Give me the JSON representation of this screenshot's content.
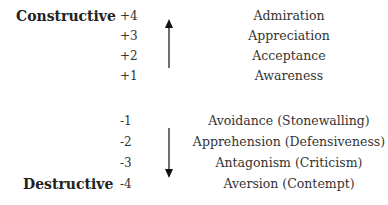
{
  "poles": {
    "constructive": "Constructive",
    "destructive": "Destructive"
  },
  "scale": {
    "positive": [
      {
        "value": "+4",
        "term": "Admiration"
      },
      {
        "value": "+3",
        "term": "Appreciation"
      },
      {
        "value": "+2",
        "term": "Acceptance"
      },
      {
        "value": "+1",
        "term": "Awareness"
      }
    ],
    "negative": [
      {
        "value": "-1",
        "term": "Avoidance (Stonewalling)"
      },
      {
        "value": "-2",
        "term": "Apprehension (Defensiveness)"
      },
      {
        "value": "-3",
        "term": "Antagonism (Criticism)"
      },
      {
        "value": "-4",
        "term": "Aversion (Contempt)"
      }
    ]
  },
  "arrows": {
    "up": "arrow-up-icon",
    "down": "arrow-down-icon"
  }
}
